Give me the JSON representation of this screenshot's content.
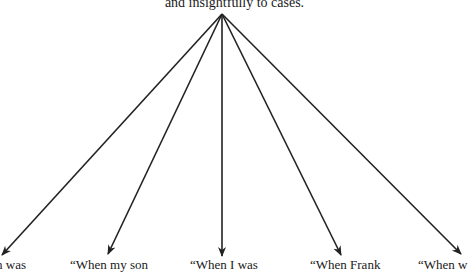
{
  "diagram": {
    "root": {
      "label": "and insightfully to cases."
    },
    "origin": {
      "x": 222,
      "y": 14
    },
    "arrows": [
      {
        "x2": 2,
        "y2": 255
      },
      {
        "x2": 108,
        "y2": 254
      },
      {
        "x2": 222,
        "y2": 256
      },
      {
        "x2": 341,
        "y2": 255
      },
      {
        "x2": 461,
        "y2": 254
      }
    ],
    "leaves": [
      {
        "label": "h was",
        "x": -4
      },
      {
        "label": "“When my son",
        "x": 70
      },
      {
        "label": "“When I was",
        "x": 190
      },
      {
        "label": "“When Frank",
        "x": 310
      },
      {
        "label": "“When w",
        "x": 418
      }
    ],
    "colors": {
      "stroke": "#222222",
      "text": "#1a1a1a",
      "background": "#ffffff"
    }
  }
}
